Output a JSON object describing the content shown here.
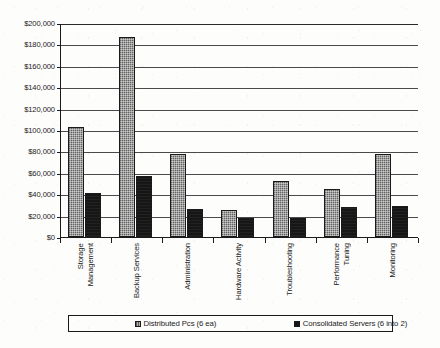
{
  "chart_data": {
    "type": "bar",
    "title": "",
    "xlabel": "",
    "ylabel": "",
    "ylim": [
      0,
      200000
    ],
    "grid": true,
    "legend_position": "bottom",
    "y_tick_labels": [
      "$200,000",
      "$180,000",
      "$160,000",
      "$140,000",
      "$120,000",
      "$100,000",
      "$80,000",
      "$60,000",
      "$40,000",
      "$20,000",
      "$0"
    ],
    "y_tick_values": [
      200000,
      180000,
      160000,
      140000,
      120000,
      100000,
      80000,
      60000,
      40000,
      20000,
      0
    ],
    "categories": [
      "Storage\nManagement",
      "Backup Services",
      "Administration",
      "Hardware Activity",
      "Troubleshooting",
      "Performance\nTuning",
      "Monitoring"
    ],
    "series": [
      {
        "name": "Distributed Pcs (6 ea)",
        "color": "#8d8d8d",
        "values": [
          103000,
          187000,
          78000,
          25000,
          52000,
          45000,
          78000
        ]
      },
      {
        "name": "Consolidated Servers  (6 into 2)",
        "color": "#161616",
        "values": [
          41000,
          57000,
          26000,
          18000,
          18000,
          28000,
          29000
        ]
      }
    ]
  },
  "legend": {
    "entries": [
      {
        "label": "Distributed Pcs (6 ea)"
      },
      {
        "label": "Consolidated Servers  (6 into 2)"
      }
    ]
  }
}
